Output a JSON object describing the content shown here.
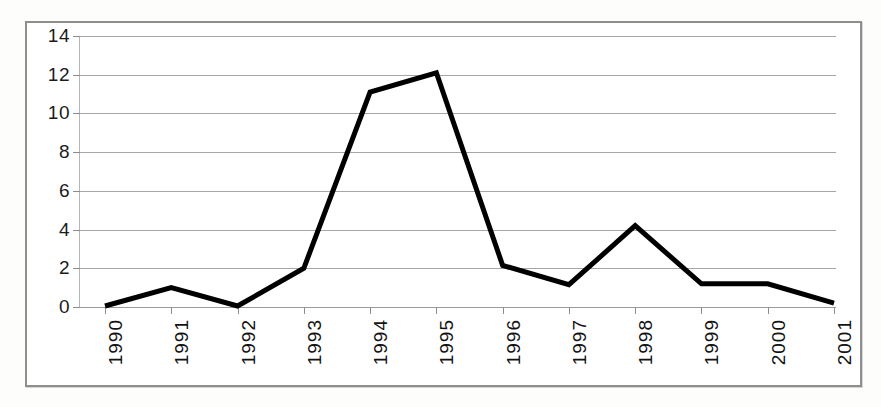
{
  "chart_data": {
    "type": "line",
    "title": "",
    "subtitle": "",
    "xlabel": "",
    "ylabel": "",
    "categories": [
      "1990",
      "1991",
      "1992",
      "1993",
      "1994",
      "1995",
      "1996",
      "1997",
      "1998",
      "1999",
      "2000",
      "2001"
    ],
    "values": [
      0.05,
      1.0,
      0.05,
      2.0,
      11.1,
      12.1,
      2.15,
      1.15,
      4.2,
      1.2,
      1.2,
      0.2
    ],
    "series": [
      {
        "name": "",
        "values": [
          0.05,
          1.0,
          0.05,
          2.0,
          11.1,
          12.1,
          2.15,
          1.15,
          4.2,
          1.2,
          1.2,
          0.2
        ]
      }
    ],
    "ylim": [
      0,
      14
    ],
    "xlim": [
      "1990",
      "2001"
    ],
    "y_ticks": [
      0,
      2,
      4,
      6,
      8,
      10,
      12,
      14
    ],
    "y_tick_labels": [
      "0",
      "2",
      "4",
      "6",
      "8",
      "10",
      "12",
      "14"
    ],
    "x_tick_labels": [
      "1990",
      "1991",
      "1992",
      "1993",
      "1994",
      "1995",
      "1996",
      "1997",
      "1998",
      "1999",
      "2000",
      "2001"
    ],
    "x_tick_label_rotation": 90,
    "grid": true,
    "grid_axis": "y",
    "legend": false,
    "legend_position": "none",
    "annotations": [],
    "line_color": "#000000",
    "line_width": 5,
    "markers": false,
    "grid_color": "#a6a6a6",
    "axis_color": "#8c8c8c",
    "frame_color": "#8e8e8e",
    "plot_background": "#ffffff",
    "figure_background": "#fdfdfc"
  }
}
